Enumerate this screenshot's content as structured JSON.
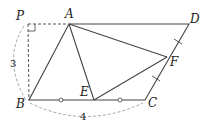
{
  "diagram": {
    "points": {
      "P": {
        "label": "P",
        "x": 28,
        "y": 24
      },
      "A": {
        "label": "A",
        "x": 69,
        "y": 24
      },
      "D": {
        "label": "D",
        "x": 189,
        "y": 24
      },
      "B": {
        "label": "B",
        "x": 29,
        "y": 100
      },
      "C": {
        "label": "C",
        "x": 145,
        "y": 100
      },
      "E": {
        "label": "E",
        "x": 94,
        "y": 100
      },
      "F": {
        "label": "F",
        "x": 167,
        "y": 57
      }
    },
    "dimensions": {
      "height_label": "3",
      "base_label": "4"
    },
    "colors": {
      "line": "#444444",
      "dashed": "#888888"
    }
  }
}
